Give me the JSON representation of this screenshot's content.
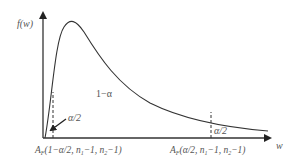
{
  "figure": {
    "type": "F-distribution density with two-tailed critical region",
    "y_axis_label": "f(w)",
    "x_axis_label": "w",
    "central_region_label": "1−α",
    "left_tail_label": "α/2",
    "right_tail_label": "α/2",
    "left_critical_value": {
      "symbol": "A",
      "subscript": "F",
      "args": "(1−α/2, n",
      "n1_sub": "1",
      "mid": "−1, n",
      "n2_sub": "2",
      "end": "−1)"
    },
    "right_critical_value": {
      "symbol": "A",
      "subscript": "F",
      "args": "(α/2, n",
      "n1_sub": "1",
      "mid": "−1, n",
      "n2_sub": "2",
      "end": "−1)"
    },
    "colors": {
      "axis": "#333333",
      "curve": "#333333",
      "text": "#555555"
    }
  }
}
